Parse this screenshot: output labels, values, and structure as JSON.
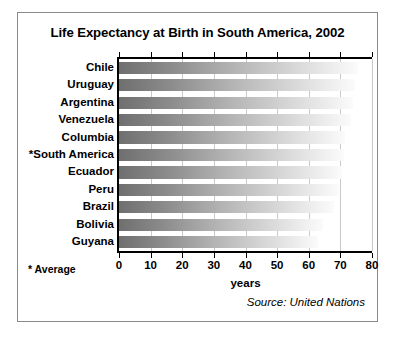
{
  "chart_data": {
    "type": "bar",
    "orientation": "horizontal",
    "title": "Life Expectancy at Birth in South America, 2002",
    "xlabel": "years",
    "ylabel": "",
    "xlim": [
      0,
      80
    ],
    "xticks": [
      0,
      10,
      20,
      30,
      40,
      50,
      60,
      70,
      80
    ],
    "grid": true,
    "legend": null,
    "categories": [
      "Chile",
      "Uruguay",
      "Argentina",
      "Venezuela",
      "Columbia",
      "*South America",
      "Ecuador",
      "Peru",
      "Brazil",
      "Bolivia",
      "Guyana"
    ],
    "values": [
      75.5,
      74.5,
      74.0,
      73.5,
      71.5,
      71.0,
      70.5,
      69.5,
      68.0,
      64.5,
      63.0
    ],
    "annotations": [
      "* Average",
      "Source: United Nations"
    ]
  },
  "footnote": "* Average",
  "source": "Source: United Nations"
}
